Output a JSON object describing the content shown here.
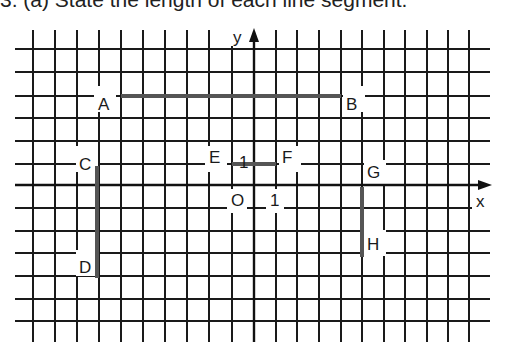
{
  "heading": "3. (a) State the length of each line segment.",
  "axes": {
    "x_label": "x",
    "y_label": "y",
    "origin_label": "O",
    "x_unit_label": "1",
    "y_unit_label": "1"
  },
  "grid": {
    "vertical_lines_x": [
      33,
      55,
      77,
      99,
      121,
      143,
      165,
      187,
      209,
      232,
      254,
      276,
      297,
      319,
      341,
      362,
      384,
      405,
      427,
      448,
      469
    ],
    "horizontal_lines_y": [
      49,
      72,
      96,
      118,
      141,
      164,
      185,
      208,
      231,
      253,
      276,
      299,
      321
    ],
    "unit_px": 22
  },
  "points": [
    {
      "name": "A",
      "label": "A"
    },
    {
      "name": "B",
      "label": "B"
    },
    {
      "name": "C",
      "label": "C"
    },
    {
      "name": "D",
      "label": "D"
    },
    {
      "name": "E",
      "label": "E"
    },
    {
      "name": "F",
      "label": "F"
    },
    {
      "name": "G",
      "label": "G"
    },
    {
      "name": "H",
      "label": "H"
    }
  ],
  "segments": [
    {
      "name": "AB",
      "from": "A",
      "to": "B",
      "orientation": "horizontal",
      "length_units": 10
    },
    {
      "name": "CD",
      "from": "C",
      "to": "D",
      "orientation": "vertical",
      "length_units": 5
    },
    {
      "name": "EF",
      "from": "E",
      "to": "F",
      "orientation": "horizontal",
      "length_units": 2
    },
    {
      "name": "GH",
      "from": "G",
      "to": "H",
      "orientation": "vertical",
      "length_units": 3
    }
  ],
  "colors": {
    "grid": "#1a1a1a",
    "segment": "#555555",
    "background": "#ffffff"
  }
}
